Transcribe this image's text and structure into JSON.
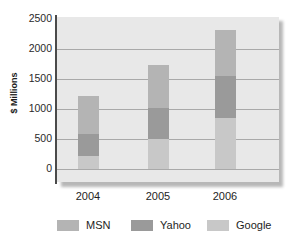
{
  "chart_data": {
    "type": "bar",
    "subtype": "stacked",
    "title": "",
    "xlabel": "",
    "ylabel": "$ Millions",
    "categories": [
      "2004",
      "2005",
      "2006"
    ],
    "series": [
      {
        "name": "Google",
        "color": "#c8c8c8",
        "values": [
          215,
          500,
          855
        ]
      },
      {
        "name": "Yahoo",
        "color": "#9a9a9a",
        "values": [
          365,
          520,
          695
        ]
      },
      {
        "name": "MSN",
        "color": "#b4b4b4",
        "values": [
          635,
          710,
          775
        ]
      }
    ],
    "totals": [
      1215,
      1730,
      2325
    ],
    "stack_order_bottom_to_top": [
      "Google",
      "Yahoo",
      "MSN"
    ],
    "ylim": [
      0,
      2500
    ],
    "yticks": [
      0,
      500,
      1000,
      1500,
      2000,
      2500
    ],
    "ytick_labels": [
      "0",
      "500",
      "1000",
      "1500",
      "2000",
      "2500"
    ],
    "grid": true,
    "grid_axis": "y",
    "legend_position": "bottom",
    "plot_background": "#e8e8e8"
  },
  "legend": {
    "items": [
      {
        "label": "MSN",
        "color": "#b4b4b4"
      },
      {
        "label": "Yahoo",
        "color": "#9a9a9a"
      },
      {
        "label": "Google",
        "color": "#c8c8c8"
      }
    ]
  }
}
